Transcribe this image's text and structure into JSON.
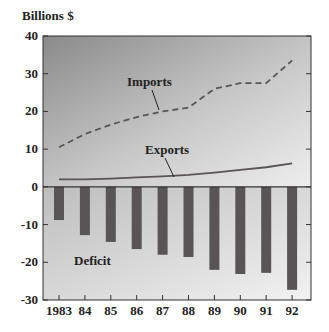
{
  "chart_data": {
    "type": "bar+line",
    "title": "",
    "ylabel": "Billions $",
    "xlabel": "",
    "ylim": [
      -30,
      40
    ],
    "yticks": [
      40,
      30,
      20,
      10,
      0,
      -10,
      -20,
      -30
    ],
    "categories": [
      "1983",
      "84",
      "85",
      "86",
      "87",
      "88",
      "89",
      "90",
      "91",
      "92"
    ],
    "series": [
      {
        "name": "Imports",
        "type": "line",
        "style": "dashed",
        "values": [
          10.5,
          14,
          16.5,
          18.5,
          20,
          21,
          26,
          27.5,
          27.5,
          33.5
        ]
      },
      {
        "name": "Exports",
        "type": "line",
        "style": "solid",
        "values": [
          2,
          2,
          2.2,
          2.5,
          2.8,
          3.2,
          3.8,
          4.5,
          5.2,
          6.2
        ]
      },
      {
        "name": "Deficit",
        "type": "bar",
        "values": [
          -8.8,
          -12.8,
          -14.6,
          -16.5,
          -18,
          -18.6,
          -22,
          -23.1,
          -22.8,
          -27.3
        ]
      }
    ],
    "annotations": [
      "Imports",
      "Exports",
      "Deficit"
    ],
    "grid": false,
    "legend": "inline annotations"
  },
  "colors": {
    "bar": "#5a5357",
    "line": "#5a5357",
    "frame": "#333333"
  }
}
